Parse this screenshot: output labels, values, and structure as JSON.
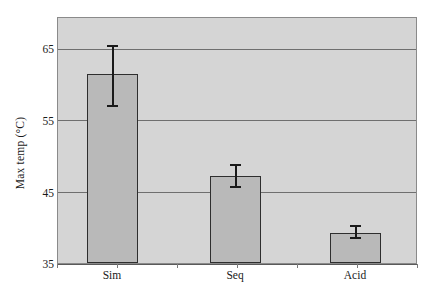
{
  "chart_data": {
    "type": "bar",
    "title": "",
    "xlabel": "",
    "ylabel": "Max temp (°C)",
    "categories": [
      "Sim",
      "Seq",
      "Acid"
    ],
    "values": [
      61.5,
      47.2,
      39.2
    ],
    "error_low": [
      56.8,
      45.5,
      38.3
    ],
    "error_high": [
      65.5,
      48.9,
      40.3
    ],
    "error_minus": [
      4.7,
      1.7,
      0.9
    ],
    "error_plus": [
      4.0,
      1.7,
      1.1
    ],
    "ylim": [
      35,
      69.3
    ],
    "yticks": [
      35,
      45,
      55,
      65
    ],
    "ytick_labels": [
      "35",
      "45",
      "55",
      "65"
    ],
    "grid": true,
    "legend": null,
    "legend_position": "none",
    "series": [
      {
        "name": "Max temp",
        "values": [
          61.5,
          47.2,
          39.2
        ]
      }
    ],
    "colors": {
      "bar_fill": "#b9b9b9",
      "bar_edge": "#2e2e2e",
      "plot_background": "#d5d5d5",
      "gridline": "#6f6f6f",
      "axis": "#5a5a5a",
      "error_bar": "#1a1a1a",
      "text": "#1a1a1a",
      "figure_background": "#ffffff"
    }
  }
}
